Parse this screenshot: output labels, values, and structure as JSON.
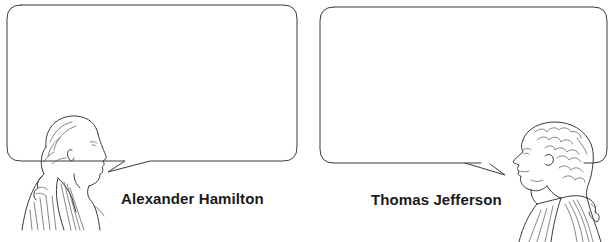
{
  "panels": [
    {
      "id": "left",
      "speaker": {
        "name": "Alexander Hamilton",
        "portrait_icon": "hamilton-portrait-icon",
        "facing": "right"
      },
      "speech_bubble": {
        "text": "",
        "tail_direction": "left-bottom"
      }
    },
    {
      "id": "right",
      "speaker": {
        "name": "Thomas Jefferson",
        "portrait_icon": "jefferson-portrait-icon",
        "facing": "left"
      },
      "speech_bubble": {
        "text": "",
        "tail_direction": "right-bottom"
      }
    }
  ],
  "colors": {
    "background": "#ffffff",
    "line": "#3a3a3a",
    "text": "#1a1a1a"
  }
}
